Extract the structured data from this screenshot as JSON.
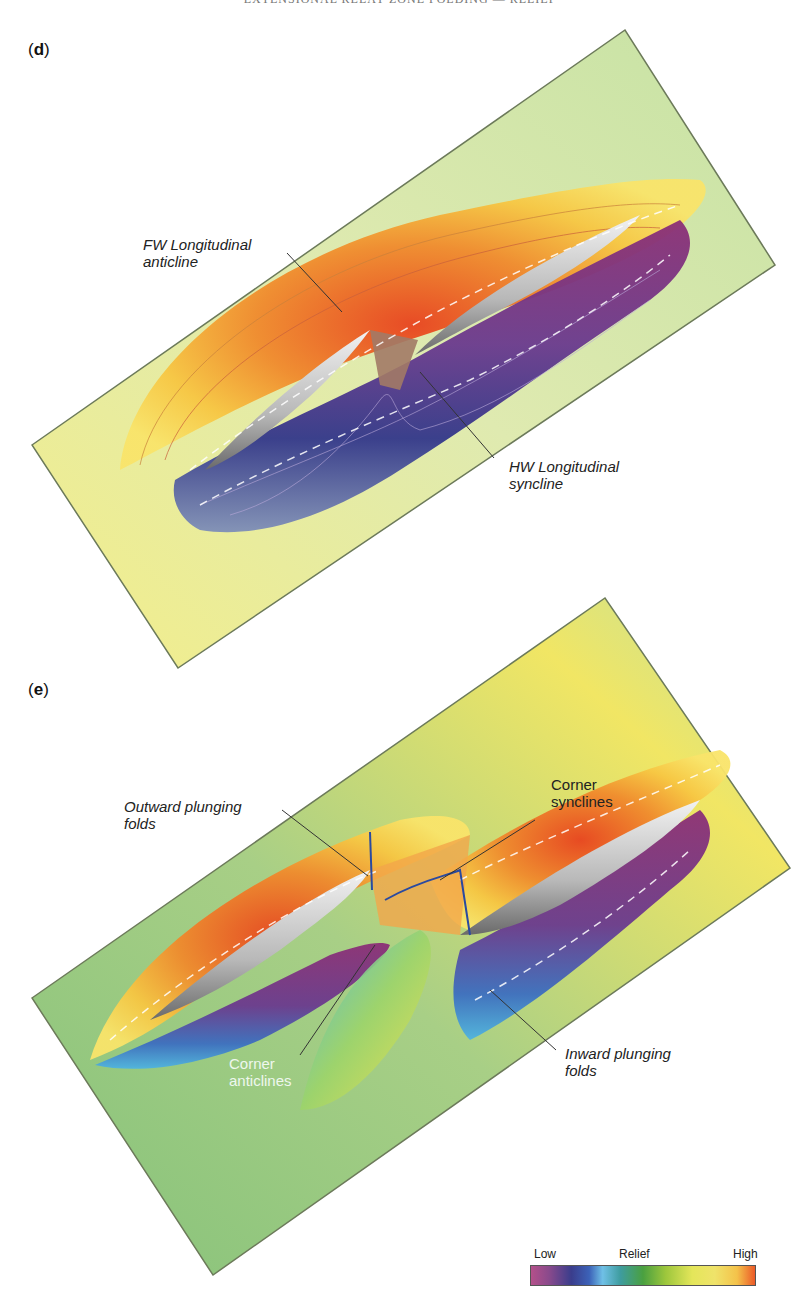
{
  "header": {
    "text": "EXTENSIONAL RELAY ZONE FOLDING — RELIEF"
  },
  "panels": [
    {
      "id": "d",
      "label": "d",
      "annotations": [
        {
          "text_line1": "FW Longitudinal",
          "text_line2": "anticline"
        },
        {
          "text_line1": "HW Longitudinal",
          "text_line2": "syncline"
        }
      ]
    },
    {
      "id": "e",
      "label": "e",
      "annotations": [
        {
          "text_line1": "Outward plunging",
          "text_line2": "folds"
        },
        {
          "text_line1": "Corner",
          "text_line2": "synclines"
        },
        {
          "text_line1": "Corner",
          "text_line2": "anticlines"
        },
        {
          "text_line1": "Inward plunging",
          "text_line2": "folds"
        }
      ]
    }
  ],
  "legend": {
    "low_label": "Low",
    "title": "Relief",
    "high_label": "High",
    "scale_colors": [
      "#b4508a",
      "#3a3d8c",
      "#6fc0e6",
      "#4aa040",
      "#e4e65a",
      "#ec5a28"
    ]
  }
}
